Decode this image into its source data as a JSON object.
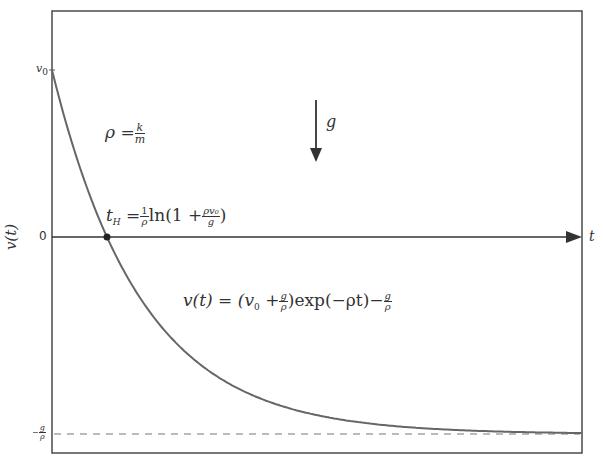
{
  "chart_data": {
    "type": "line",
    "title": "",
    "xlabel": "t",
    "ylabel": "v(t)",
    "y_ticks": [
      "v_0",
      "0",
      "-g/ρ"
    ],
    "series": [
      {
        "name": "v(t) = (v_0 + g/ρ) exp(-ρt) - g/ρ",
        "style": "solid",
        "shape": "exponential decay from v_0 toward -g/ρ"
      },
      {
        "name": "asymptote -g/ρ",
        "style": "dashed"
      }
    ],
    "marker": {
      "label": "t_H",
      "at": "v=0"
    },
    "annotations": [
      "ρ = k/m",
      "g (downward arrow)",
      "t_H = (1/ρ) ln(1 + ρv_0/g)",
      "v(t) = (v_0 + g/ρ) exp(-ρt) - g/ρ"
    ],
    "grid": false,
    "legend": "none"
  },
  "frame": {
    "left": 52,
    "top": 11,
    "right": 582,
    "bottom": 453
  },
  "curve": {
    "x0": 52,
    "y_start": 70,
    "y_asym": 434,
    "k": 0.01117
  },
  "axis": {
    "zero_y": 237,
    "arrow_end_x": 582
  },
  "labels": {
    "v0": "v",
    "v0_sub": "0",
    "zero": "0",
    "ylabel": "v(t)",
    "xlabel": "t",
    "rho_lhs": "ρ =",
    "rho_num": "k",
    "rho_den": "m",
    "g": "g",
    "th_lhs": "t",
    "th_sub": "H",
    "th_eq": " =",
    "th_frac_num": "1",
    "th_frac_den": "ρ",
    "th_ln": "ln",
    "th_open": "(1 +",
    "th_frac2_num": "ρv₀",
    "th_frac2_den": "g",
    "th_close": ")",
    "vt_lhs": "v(t) = (v",
    "vt_sub": "0",
    "vt_plus": " +",
    "vt_f1_num": "g",
    "vt_f1_den": "ρ",
    "vt_mid": ")exp(−ρt)−",
    "vt_f2_num": "g",
    "vt_f2_den": "ρ",
    "asym_sign": "−",
    "asym_num": "g",
    "asym_den": "ρ"
  },
  "colors": {
    "curve": "#666666",
    "frame": "#555555",
    "axis": "#333333",
    "dash": "#777777"
  }
}
